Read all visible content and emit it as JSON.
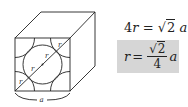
{
  "diagram": {
    "cube": {
      "front_face": {
        "x": 15,
        "y": 38,
        "w": 55,
        "h": 53
      },
      "back_offset": {
        "dx": 25,
        "dy": -26
      },
      "stroke": "#222222"
    },
    "labels": {
      "r_label": "r",
      "edge_label": "a"
    },
    "equations": {
      "eq1": {
        "lhs_coef": "4",
        "lhs_var": "r",
        "equals": "=",
        "sqrt_of": "2",
        "rhs_var": "a"
      },
      "eq2": {
        "lhs_var": "r",
        "equals": "=",
        "num_sqrt_of": "2",
        "den": "4",
        "rhs_var": "a",
        "highlight": "#d6d6d6"
      }
    }
  }
}
